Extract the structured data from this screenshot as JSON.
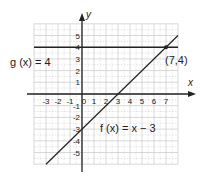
{
  "chart_data": {
    "type": "line",
    "title": "",
    "xlabel": "x",
    "ylabel": "y",
    "xlim": [
      -4,
      8
    ],
    "ylim": [
      -6,
      6
    ],
    "grid": true,
    "x_ticks": [
      -3,
      -2,
      -1,
      0,
      1,
      2,
      3,
      4,
      5,
      6,
      7
    ],
    "y_ticks": [
      5,
      4,
      3,
      2,
      1,
      -1,
      -2,
      -3,
      -4,
      -5
    ],
    "series": [
      {
        "name": "g(x) = 4",
        "equation": "g(x) = 4",
        "x": [
          -4,
          8
        ],
        "y": [
          4,
          4
        ]
      },
      {
        "name": "f(x) = x − 3",
        "equation": "f(x) = x − 3",
        "x": [
          -3,
          8
        ],
        "y": [
          -6,
          5
        ]
      }
    ],
    "annotations": [
      {
        "label": "(7,4)",
        "x": 7,
        "y": 4,
        "type": "intersection-point"
      }
    ]
  },
  "labels": {
    "x_axis": "x",
    "y_axis": "y",
    "g_label": "g (x) = 4",
    "f_label": "f (x) = x − 3",
    "point_label": "(7,4)"
  },
  "colors": {
    "grid": "#c8c8c8",
    "axis": "#222222",
    "line": "#222222",
    "background": "#ffffff"
  }
}
